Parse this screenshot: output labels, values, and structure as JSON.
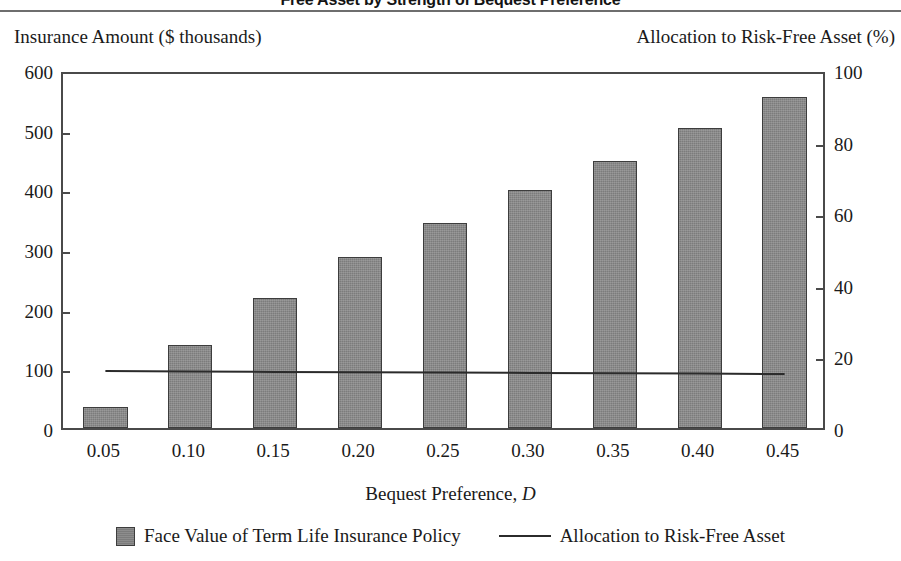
{
  "chart_title": "Free Asset by Strength of Bequest Preference",
  "left_axis_caption": "Insurance Amount ($ thousands)",
  "right_axis_caption": "Allocation to Risk-Free Asset (%)",
  "x_axis_title_prefix": "Bequest Preference, ",
  "x_axis_title_symbol": "D",
  "legend": [
    {
      "label": "Face Value of Term Life Insurance Policy",
      "marker": "bar-swatch",
      "color": "#7c7c7c"
    },
    {
      "label": "Allocation to Risk-Free Asset",
      "marker": "line-swatch",
      "color": "#2b2b2b"
    }
  ],
  "chart_data": {
    "type": "bar",
    "title": "Free Asset by Strength of Bequest Preference",
    "xlabel": "Bequest Preference, D",
    "ylabel": "Insurance Amount ($ thousands)",
    "y2label": "Allocation to Risk-Free Asset (%)",
    "categories": [
      "0.05",
      "0.10",
      "0.15",
      "0.20",
      "0.25",
      "0.30",
      "0.35",
      "0.40",
      "0.45"
    ],
    "ylim": [
      0,
      600
    ],
    "y2lim": [
      0,
      100
    ],
    "yticks": [
      "0",
      "100",
      "200",
      "300",
      "400",
      "500",
      "600"
    ],
    "ytick_values": [
      0,
      100,
      200,
      300,
      400,
      500,
      600
    ],
    "y2ticks": [
      "0",
      "20",
      "40",
      "60",
      "80",
      "100"
    ],
    "y2tick_values": [
      0,
      20,
      40,
      60,
      80,
      100
    ],
    "grid": false,
    "legend_position": "bottom",
    "series": [
      {
        "name": "Face Value of Term Life Insurance Policy",
        "type": "bar",
        "axis": "left",
        "color": "#7c7c7c",
        "values": [
          35,
          139,
          218,
          286,
          344,
          399,
          447,
          503,
          555
        ]
      },
      {
        "name": "Allocation to Risk-Free Asset",
        "type": "line",
        "axis": "right",
        "color": "#2b2b2b",
        "values": [
          17.0,
          16.9,
          16.8,
          16.7,
          16.6,
          16.5,
          16.4,
          16.3,
          16.2
        ]
      }
    ]
  }
}
